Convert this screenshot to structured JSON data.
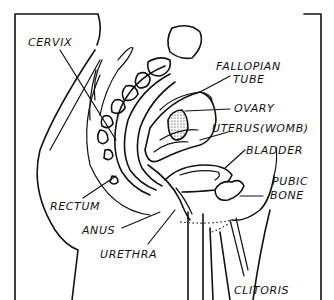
{
  "diagram": {
    "labels": {
      "cervix": "CERVIX",
      "fallopian_tube_line1": "FALLOPIAN",
      "fallopian_tube_line2": "TUBE",
      "ovary": "OVARY",
      "uterus": "UTERUS(WOMB)",
      "bladder": "BLADDER",
      "pubic_bone_line1": "PUBIC",
      "pubic_bone_line2": "BONE",
      "rectum": "RECTUM",
      "anus": "ANUS",
      "urethra": "URETHRA",
      "clitoris": "CLITORIS"
    }
  }
}
